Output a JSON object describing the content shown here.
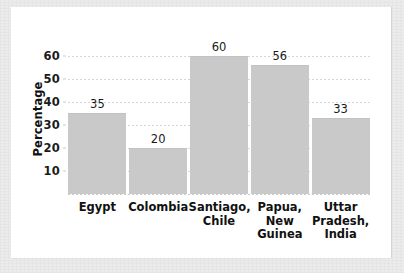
{
  "chart_data": {
    "type": "bar",
    "title": "",
    "xlabel": "",
    "ylabel": "Percentage",
    "categories": [
      "Egypt",
      "Colombia",
      "Santiago,\nChile",
      "Papua,\nNew\nGuinea",
      "Uttar\nPradesh,\nIndia"
    ],
    "values": [
      35,
      20,
      60,
      56,
      33
    ],
    "value_labels": [
      "35",
      "20",
      "60",
      "56",
      "33"
    ],
    "ylim": [
      0,
      65
    ],
    "yticks": [
      10,
      20,
      30,
      40,
      50,
      60
    ],
    "ytick_labels": [
      "10",
      "20",
      "30",
      "40",
      "50",
      "60"
    ],
    "grid": "horizontal-dotted",
    "legend": "none",
    "bar_color": "#c9c9c9",
    "grid_color": "#d6d6d8",
    "text_color": "#111111",
    "panel_color": "#ffffff",
    "frame_color": "#ebebec"
  }
}
